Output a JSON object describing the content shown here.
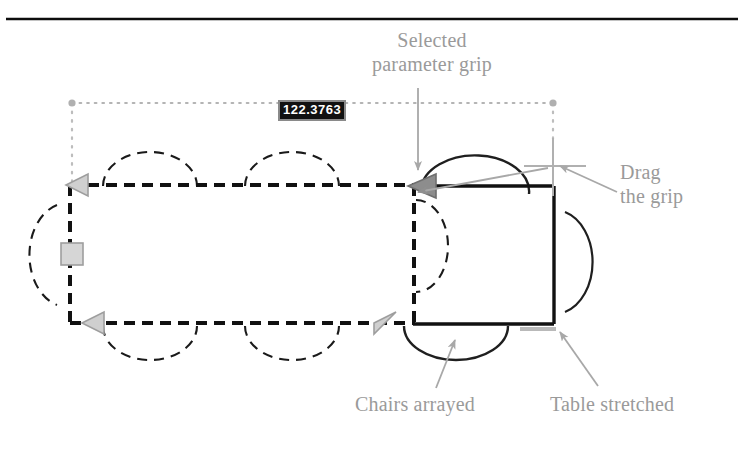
{
  "figure": {
    "type": "cad-dynamic-block-illustration",
    "background_color": "#ffffff",
    "top_rule_color": "#000000"
  },
  "dimension": {
    "name": "distance-parameter-value",
    "value": "122.3763",
    "text_color": "#ffffff",
    "background_color": "#111111",
    "border_color": "#8a8a8a"
  },
  "annotations": {
    "selected_grip": {
      "label": "Selected\nparameter grip",
      "line1": "Selected",
      "line2": "parameter grip",
      "color": "#9a9a9a"
    },
    "drag_grip": {
      "label": "Drag\nthe grip",
      "line1": "Drag",
      "line2": "the grip",
      "color": "#9a9a9a"
    },
    "chairs_arrayed": {
      "label": "Chairs arrayed",
      "color": "#9a9a9a"
    },
    "table_stretched": {
      "label": "Table stretched",
      "color": "#9a9a9a"
    }
  },
  "geometry": {
    "original_table": {
      "name": "original-table-outline",
      "style": "dashed",
      "color": "#1a1a1a",
      "x": 70,
      "y": 184,
      "width": 345,
      "height": 140
    },
    "stretched_table": {
      "name": "stretched-table-outline",
      "style": "solid",
      "color": "#1a1a1a",
      "x": 413,
      "y": 184,
      "width": 141,
      "height": 140
    },
    "dimension_line": {
      "name": "distance-parameter-line",
      "style": "dotted",
      "color": "#b0b0b0",
      "x1": 72,
      "x2": 553,
      "y": 103
    },
    "grips": [
      {
        "name": "grip-left-top",
        "shape": "triangle-left",
        "state": "unselected",
        "color": "#c8c8c8",
        "x": 70,
        "y": 184
      },
      {
        "name": "grip-left-bottom",
        "shape": "triangle-left",
        "state": "unselected",
        "color": "#c8c8c8",
        "x": 70,
        "y": 324
      },
      {
        "name": "grip-square-left",
        "shape": "square",
        "state": "unselected",
        "color": "#d4d4d4",
        "x": 70,
        "y": 254
      },
      {
        "name": "grip-selected-top",
        "shape": "triangle-right",
        "state": "selected",
        "color": "#8c8c8c",
        "x": 415,
        "y": 184
      },
      {
        "name": "grip-bottom-right",
        "shape": "triangle-right",
        "state": "unselected",
        "color": "#c8c8c8",
        "x": 390,
        "y": 324
      }
    ],
    "chair_arcs": [
      {
        "name": "chair-arc-top-1",
        "style": "dashed",
        "side": "top"
      },
      {
        "name": "chair-arc-top-2",
        "style": "dashed",
        "side": "top"
      },
      {
        "name": "chair-arc-top-new",
        "style": "solid",
        "side": "top"
      },
      {
        "name": "chair-arc-bottom-1",
        "style": "dashed",
        "side": "bottom"
      },
      {
        "name": "chair-arc-bottom-2",
        "style": "dashed",
        "side": "bottom"
      },
      {
        "name": "chair-arc-bottom-new",
        "style": "solid",
        "side": "bottom"
      },
      {
        "name": "chair-arc-left",
        "style": "dashed",
        "side": "left"
      },
      {
        "name": "chair-arc-right",
        "style": "solid",
        "side": "right"
      }
    ],
    "cursor": {
      "name": "crosshair-cursor",
      "x": 553,
      "y": 166,
      "color": "#aaaaaa"
    }
  }
}
